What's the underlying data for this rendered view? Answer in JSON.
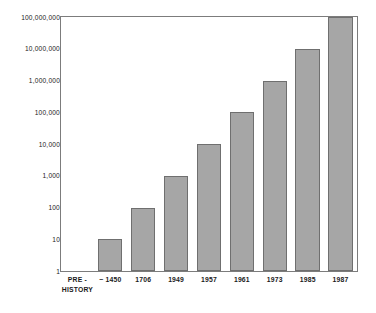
{
  "chart_data": {
    "type": "bar",
    "title": "",
    "xlabel": "",
    "ylabel": "NUMBER OF DIGITS OF PI",
    "yscale": "log",
    "ylim": [
      1,
      100000000
    ],
    "grid": false,
    "legend": null,
    "categories": [
      "PRE-HISTORY",
      "~1450",
      "1706",
      "1949",
      "1957",
      "1961",
      "1973",
      "1985",
      "1987"
    ],
    "category_lines": [
      [
        "PRE -",
        "HISTORY"
      ],
      [
        "~ 1450"
      ],
      [
        "1706"
      ],
      [
        "1949"
      ],
      [
        "1957"
      ],
      [
        "1961"
      ],
      [
        "1973"
      ],
      [
        "1985"
      ],
      [
        "1987"
      ]
    ],
    "values": [
      null,
      10,
      100,
      1000,
      10000,
      100000,
      1000000,
      10000000,
      100000000
    ],
    "value_labels": [
      "",
      "10",
      "100",
      "1,000",
      "10,000",
      "100,000",
      "1,000,000",
      "10,000,000",
      "100,000,000"
    ],
    "y_ticks": [
      1,
      10,
      100,
      1000,
      10000,
      100000,
      1000000,
      10000000,
      100000000
    ],
    "y_tick_labels": [
      "1",
      "10",
      "100",
      "1,000",
      "10,000",
      "100,000",
      "1,000,000",
      "10,000,000",
      "100,000,000"
    ],
    "bar_color": "#a6a6a6",
    "bar_edge_color": "#6f6f6f",
    "frame_color": "#7c7c7c",
    "background_color": "#ffffff"
  }
}
